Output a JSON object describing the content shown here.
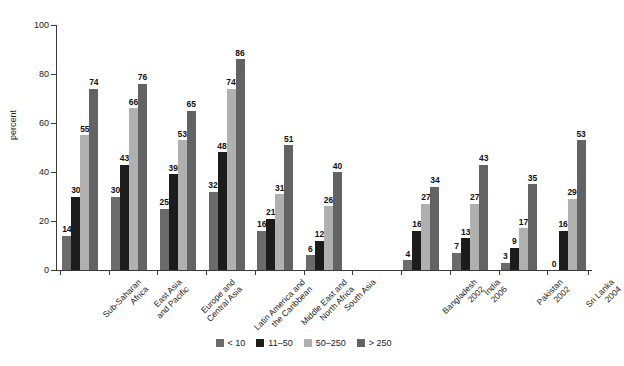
{
  "chart_data": {
    "type": "bar",
    "title": "",
    "subtitle": "",
    "xlabel": "",
    "ylabel": "percent",
    "ylim": [
      0,
      100
    ],
    "yticks": [
      0,
      20,
      40,
      60,
      80,
      100
    ],
    "grid": false,
    "legend_position": "bottom",
    "categories": [
      "Sub-Saharan Africa",
      "East Asia and Pacific",
      "Europe and Central Asia",
      "Latin America and the Caribbean",
      "Middle East and North Africa",
      "South Asia",
      "",
      "Bangladesh 2002",
      "India 2006",
      "Pakistan 2002",
      "Sri Lanka 2004"
    ],
    "series": [
      {
        "name": "< 10",
        "color": "#6b6b6b",
        "values": [
          14,
          30,
          25,
          32,
          16,
          6,
          null,
          4,
          7,
          3,
          0
        ]
      },
      {
        "name": "11-50",
        "color": "#1c1c1c",
        "values": [
          30,
          43,
          39,
          48,
          21,
          12,
          null,
          16,
          13,
          9,
          16
        ]
      },
      {
        "name": "50-250",
        "color": "#b0b0b0",
        "values": [
          55,
          66,
          53,
          74,
          31,
          26,
          null,
          27,
          27,
          17,
          29
        ]
      },
      {
        "name": "> 250",
        "color": "#636363",
        "values": [
          74,
          76,
          65,
          86,
          51,
          40,
          null,
          34,
          43,
          35,
          53
        ]
      }
    ]
  },
  "axis": {
    "y_title": "percent",
    "y_tick_labels": [
      "0",
      "20",
      "40",
      "60",
      "80",
      "100"
    ]
  },
  "groups": [
    {
      "line1": "Sub-Saharan",
      "line2": "Africa",
      "values": [
        14,
        30,
        55,
        74
      ]
    },
    {
      "line1": "East Asia",
      "line2": "and Pacific",
      "values": [
        30,
        43,
        66,
        76
      ]
    },
    {
      "line1": "Europe and",
      "line2": "Central Asia",
      "values": [
        25,
        39,
        53,
        65
      ]
    },
    {
      "line1": "Latin America and",
      "line2": "the Caribbean",
      "values": [
        32,
        48,
        74,
        86
      ]
    },
    {
      "line1": "Middle East and",
      "line2": "North Africa",
      "values": [
        16,
        21,
        31,
        51
      ]
    },
    {
      "line1": "South Asia",
      "line2": "",
      "values": [
        6,
        12,
        26,
        40
      ]
    },
    {
      "line1": "",
      "line2": "",
      "values": []
    },
    {
      "line1": "Bangladesh",
      "line2": "2002",
      "values": [
        4,
        16,
        27,
        34
      ]
    },
    {
      "line1": "India",
      "line2": "2006",
      "values": [
        7,
        13,
        27,
        43
      ]
    },
    {
      "line1": "Pakistan",
      "line2": "2002",
      "values": [
        3,
        9,
        17,
        35
      ]
    },
    {
      "line1": "Sri Lanka",
      "line2": "2004",
      "values": [
        0,
        16,
        29,
        53
      ]
    }
  ],
  "legend": {
    "items": [
      {
        "label": "< 10",
        "color": "#6b6b6b"
      },
      {
        "label": "11–50",
        "color": "#1c1c1c"
      },
      {
        "label": "50–250",
        "color": "#b0b0b0"
      },
      {
        "label": "> 250",
        "color": "#636363"
      }
    ]
  },
  "colors": {
    "axis": "#3a3a3a",
    "background": "#ffffff",
    "text": "#1a1a1a"
  }
}
